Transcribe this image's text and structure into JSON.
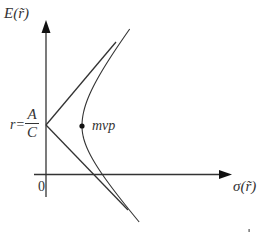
{
  "diagram": {
    "y_axis": {
      "label": "E(r̃)"
    },
    "x_axis": {
      "label": "σ(r̃)"
    },
    "origin_label": "0",
    "intercept_label": {
      "prefix": "r=",
      "numerator": "A",
      "denominator": "C"
    },
    "point_label": "mvp",
    "colors": {
      "line": "#333333",
      "background": "#ffffff"
    },
    "geometry": {
      "y_axis_x": 46,
      "y_axis_top": 20,
      "y_axis_bottom": 197,
      "x_axis_y": 174,
      "x_axis_left": 34,
      "x_axis_right": 232,
      "asymptote_vertex": [
        46,
        125
      ],
      "upper_asymptote_end": [
        116,
        42
      ],
      "lower_asymptote_end": [
        128,
        210
      ],
      "mvp_point": [
        82,
        126
      ],
      "hyperbola_top": [
        129,
        29
      ],
      "hyperbola_bottom": [
        140,
        222
      ]
    }
  }
}
